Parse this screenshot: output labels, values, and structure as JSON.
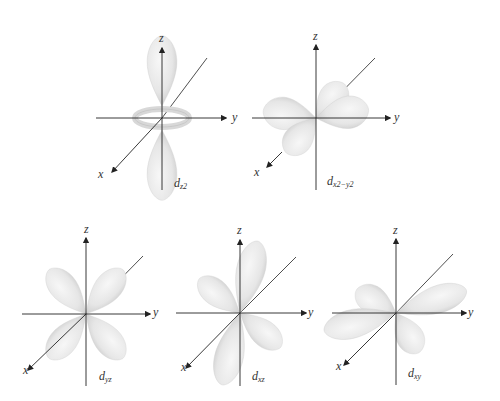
{
  "diagram": {
    "colors": {
      "lobe_fill": "#ececec",
      "lobe_shade": "#c9c9c9",
      "axis": "#222222",
      "background": "#ffffff"
    },
    "orbitals": [
      {
        "id": "dz2",
        "label_main": "d",
        "label_sub": "z2",
        "axes": {
          "x": "x",
          "y": "y",
          "z": "z"
        }
      },
      {
        "id": "dx2-y2",
        "label_main": "d",
        "label_sub": "x2−y2",
        "axes": {
          "x": "x",
          "y": "y",
          "z": "z"
        }
      },
      {
        "id": "dyz",
        "label_main": "d",
        "label_sub": "yz",
        "axes": {
          "x": "x",
          "y": "y",
          "z": "z"
        }
      },
      {
        "id": "dxz",
        "label_main": "d",
        "label_sub": "xz",
        "axes": {
          "x": "x",
          "y": "y",
          "z": "z"
        }
      },
      {
        "id": "dxy",
        "label_main": "d",
        "label_sub": "xy",
        "axes": {
          "x": "x",
          "y": "y",
          "z": "z"
        }
      }
    ]
  }
}
